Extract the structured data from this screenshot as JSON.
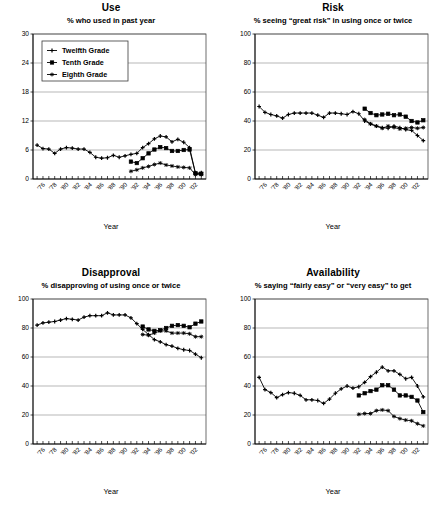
{
  "figure": {
    "xlabel": "Year",
    "legend": {
      "position": "top-left-of-panel-1",
      "entries": [
        {
          "label": "Twelfth Grade",
          "marker": "plus"
        },
        {
          "label": "Tenth Grade",
          "marker": "square"
        },
        {
          "label": "Eighth Grade",
          "marker": "star"
        }
      ]
    },
    "xtick_labels": [
      "'76",
      "'78",
      "'80",
      "'82",
      "'84",
      "'86",
      "'88",
      "'90",
      "'92",
      "'94",
      "'96",
      "'98",
      "'00",
      "'02"
    ],
    "xtick_years": [
      1976,
      1978,
      1980,
      1982,
      1984,
      1986,
      1988,
      1990,
      1992,
      1994,
      1996,
      1998,
      2000,
      2002
    ],
    "xlim": [
      1974.3,
      2003.8
    ]
  },
  "chart_data": [
    {
      "type": "line",
      "title": "Use",
      "subtitle": "% who used in past year",
      "xlabel": "Year",
      "ylabel": "",
      "ylim": [
        0,
        30
      ],
      "yticks": [
        0,
        6,
        12,
        18,
        24,
        30
      ],
      "ytick_labels": [
        "0",
        "6",
        "12",
        "18",
        "24",
        "30"
      ],
      "grid": true,
      "legend": true,
      "series": [
        {
          "name": "Twelfth Grade",
          "marker": "plus",
          "x": [
            1975,
            1976,
            1977,
            1978,
            1979,
            1980,
            1981,
            1982,
            1983,
            1984,
            1985,
            1986,
            1987,
            1988,
            1989,
            1990,
            1991,
            1992,
            1993,
            1994,
            1995,
            1996,
            1997,
            1998,
            1999,
            2000,
            2001,
            2002,
            2003
          ],
          "values": [
            7.0,
            6.3,
            6.2,
            5.3,
            6.2,
            6.5,
            6.4,
            6.2,
            6.2,
            5.5,
            4.5,
            4.3,
            4.4,
            4.9,
            4.5,
            4.8,
            5.1,
            5.3,
            6.5,
            7.3,
            8.3,
            8.9,
            8.7,
            7.7,
            8.2,
            7.6,
            6.5,
            1.2,
            1.3
          ]
        },
        {
          "name": "Tenth Grade",
          "marker": "square",
          "x": [
            1991,
            1992,
            1993,
            1994,
            1995,
            1996,
            1997,
            1998,
            1999,
            2000,
            2001,
            2002,
            2003
          ],
          "values": [
            3.6,
            3.3,
            4.3,
            5.3,
            6.1,
            6.6,
            6.4,
            5.8,
            5.8,
            6.0,
            6.1,
            1.2,
            1.1
          ]
        },
        {
          "name": "Eighth Grade",
          "marker": "star",
          "x": [
            1991,
            1992,
            1993,
            1994,
            1995,
            1996,
            1997,
            1998,
            1999,
            2000,
            2001,
            2002,
            2003
          ],
          "values": [
            1.6,
            1.9,
            2.3,
            2.6,
            3.0,
            3.3,
            2.9,
            2.7,
            2.5,
            2.4,
            2.3,
            0.9,
            0.9
          ]
        }
      ]
    },
    {
      "type": "line",
      "title": "Risk",
      "subtitle": "% seeing “great risk” in using once or twice",
      "xlabel": "Year",
      "ylabel": "",
      "ylim": [
        0,
        100
      ],
      "yticks": [
        0,
        20,
        40,
        60,
        80,
        100
      ],
      "ytick_labels": [
        "0",
        "20",
        "40",
        "60",
        "80",
        "100"
      ],
      "grid": true,
      "legend": false,
      "series": [
        {
          "name": "Twelfth Grade",
          "marker": "plus",
          "x": [
            1975,
            1976,
            1977,
            1978,
            1979,
            1980,
            1981,
            1982,
            1983,
            1984,
            1985,
            1986,
            1987,
            1988,
            1989,
            1990,
            1991,
            1992,
            1993,
            1994,
            1995,
            1996,
            1997,
            1998,
            1999,
            2000,
            2001,
            2002,
            2003
          ],
          "values": [
            50.0,
            46.0,
            44.5,
            43.5,
            42.0,
            44.5,
            45.5,
            45.5,
            45.5,
            45.5,
            44.0,
            42.5,
            45.5,
            45.5,
            45.0,
            44.5,
            46.5,
            45.0,
            40.0,
            38.0,
            36.5,
            35.5,
            35.0,
            36.5,
            35.5,
            34.0,
            33.5,
            30.0,
            26.5
          ]
        },
        {
          "name": "Tenth Grade",
          "marker": "square",
          "x": [
            1993,
            1994,
            1995,
            1996,
            1997,
            1998,
            1999,
            2000,
            2001,
            2002,
            2003
          ],
          "values": [
            48.5,
            45.5,
            44.0,
            44.5,
            45.0,
            44.0,
            44.5,
            43.0,
            40.0,
            39.0,
            40.5
          ]
        },
        {
          "name": "Eighth Grade",
          "marker": "star",
          "x": [
            1993,
            1994,
            1995,
            1996,
            1997,
            1998,
            1999,
            2000,
            2001,
            2002,
            2003
          ],
          "values": [
            41.0,
            38.0,
            36.5,
            35.0,
            36.5,
            35.5,
            34.5,
            35.0,
            35.5,
            35.0,
            35.5
          ]
        }
      ]
    },
    {
      "type": "line",
      "title": "Disapproval",
      "subtitle": "% disapproving of using once or twice",
      "xlabel": "Year",
      "ylabel": "",
      "ylim": [
        0,
        100
      ],
      "yticks": [
        0,
        20,
        40,
        60,
        80,
        100
      ],
      "ytick_labels": [
        "0",
        "20",
        "40",
        "60",
        "80",
        "100"
      ],
      "grid": true,
      "legend": false,
      "series": [
        {
          "name": "Twelfth Grade",
          "marker": "plus",
          "x": [
            1975,
            1976,
            1977,
            1978,
            1979,
            1980,
            1981,
            1982,
            1983,
            1984,
            1985,
            1986,
            1987,
            1988,
            1989,
            1990,
            1991,
            1992,
            1993,
            1994,
            1995,
            1996,
            1997,
            1998,
            1999,
            2000,
            2001,
            2002,
            2003
          ],
          "values": [
            82.0,
            83.5,
            84.0,
            84.5,
            85.5,
            86.5,
            86.0,
            85.5,
            87.5,
            88.5,
            88.5,
            88.5,
            90.5,
            89.0,
            89.0,
            89.0,
            87.0,
            83.0,
            79.0,
            75.5,
            72.0,
            70.5,
            68.5,
            67.5,
            66.0,
            65.0,
            64.5,
            62.0,
            59.5
          ]
        },
        {
          "name": "Tenth Grade",
          "marker": "square",
          "x": [
            1993,
            1994,
            1995,
            1996,
            1997,
            1998,
            1999,
            2000,
            2001,
            2002,
            2003
          ],
          "values": [
            81.0,
            79.0,
            78.0,
            78.5,
            80.0,
            81.5,
            82.0,
            81.5,
            80.5,
            83.0,
            84.5
          ]
        },
        {
          "name": "Eighth Grade",
          "marker": "star",
          "x": [
            1993,
            1994,
            1995,
            1996,
            1997,
            1998,
            1999,
            2000,
            2001,
            2002,
            2003
          ],
          "values": [
            75.5,
            75.0,
            76.5,
            78.0,
            78.0,
            76.5,
            76.5,
            76.5,
            76.0,
            74.0,
            74.0
          ]
        }
      ]
    },
    {
      "type": "line",
      "title": "Availability",
      "subtitle": "% saying “fairly easy” or “very easy” to get",
      "xlabel": "Year",
      "ylabel": "",
      "ylim": [
        0,
        100
      ],
      "yticks": [
        0,
        20,
        40,
        60,
        80,
        100
      ],
      "ytick_labels": [
        "0",
        "20",
        "40",
        "60",
        "80",
        "100"
      ],
      "grid": true,
      "legend": false,
      "series": [
        {
          "name": "Twelfth Grade",
          "marker": "plus",
          "x": [
            1975,
            1976,
            1977,
            1978,
            1979,
            1980,
            1981,
            1982,
            1983,
            1984,
            1985,
            1986,
            1987,
            1988,
            1989,
            1990,
            1991,
            1992,
            1993,
            1994,
            1995,
            1996,
            1997,
            1998,
            1999,
            2000,
            2001,
            2002,
            2003
          ],
          "values": [
            46.0,
            37.5,
            35.5,
            32.0,
            34.0,
            35.5,
            35.0,
            33.5,
            30.5,
            30.5,
            30.0,
            28.0,
            31.0,
            35.0,
            38.0,
            40.0,
            38.5,
            39.5,
            42.5,
            46.5,
            49.5,
            53.0,
            50.5,
            50.5,
            48.0,
            45.0,
            46.0,
            40.0,
            32.5
          ]
        },
        {
          "name": "Tenth Grade",
          "marker": "square",
          "x": [
            1992,
            1993,
            1994,
            1995,
            1996,
            1997,
            1998,
            1999,
            2000,
            2001,
            2002,
            2003
          ],
          "values": [
            33.5,
            35.0,
            36.5,
            37.5,
            40.5,
            40.5,
            37.5,
            33.5,
            33.5,
            32.5,
            30.0,
            22.0
          ]
        },
        {
          "name": "Eighth Grade",
          "marker": "star",
          "x": [
            1992,
            1993,
            1994,
            1995,
            1996,
            1997,
            1998,
            1999,
            2000,
            2001,
            2002,
            2003
          ],
          "values": [
            20.5,
            21.0,
            21.0,
            23.0,
            23.5,
            23.0,
            19.0,
            17.5,
            16.5,
            16.0,
            14.0,
            12.5
          ]
        }
      ]
    }
  ]
}
